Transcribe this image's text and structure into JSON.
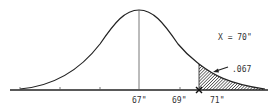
{
  "diagram": {
    "type": "normal-distribution-curve",
    "mean_label": "67\"",
    "tick_labels": [
      {
        "text": "67\"",
        "x": 139
      },
      {
        "text": "69\"",
        "x": 180
      },
      {
        "text": "71\"",
        "x": 214
      }
    ],
    "x_value_label": "X = 70\"",
    "shaded_area_label": ".067",
    "shaded_region": "right tail beyond X = 70\"",
    "colors": {
      "line": "#222222",
      "hatch": "#222222",
      "text": "#333333"
    }
  }
}
